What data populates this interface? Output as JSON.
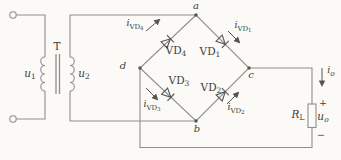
{
  "colors": {
    "background": "#fbfaf6",
    "wire": "#8e8e8e",
    "symbol": "#555555",
    "text": "#3d3d3d"
  },
  "transformer": {
    "core_label": "T",
    "primary_voltage": {
      "base": "u",
      "sub": "1"
    },
    "secondary_voltage": {
      "base": "u",
      "sub": "2"
    }
  },
  "nodes": {
    "top": "a",
    "bottom": "b",
    "right": "c",
    "left": "d"
  },
  "bridge": {
    "vd1": {
      "name": {
        "base": "VD",
        "sub": "1"
      },
      "current": {
        "base": "i",
        "sub": "VD",
        "subsub": "1"
      }
    },
    "vd2": {
      "name": {
        "base": "VD",
        "sub": "2"
      },
      "current": {
        "base": "i",
        "sub": "VD",
        "subsub": "2"
      }
    },
    "vd3": {
      "name": {
        "base": "VD",
        "sub": "3"
      },
      "current": {
        "base": "i",
        "sub": "VD",
        "subsub": "3"
      }
    },
    "vd4": {
      "name": {
        "base": "VD",
        "sub": "4"
      },
      "current": {
        "base": "i",
        "sub": "VD",
        "subsub": "4"
      }
    }
  },
  "output": {
    "current": {
      "base": "i",
      "sub": "o"
    },
    "resistor": {
      "base": "R",
      "sub": "L"
    },
    "voltage": {
      "base": "u",
      "sub": "o"
    },
    "polarity_plus": "+",
    "polarity_minus": "−"
  }
}
